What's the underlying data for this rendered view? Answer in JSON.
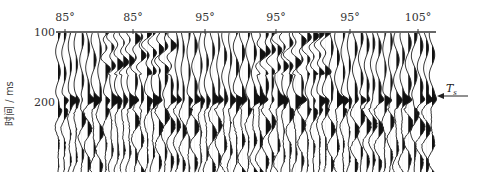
{
  "chart_data": {
    "type": "seismic-wiggle-section",
    "title": "",
    "xlabel": "",
    "ylabel": "时间 / ms",
    "x_tick_labels": [
      "85°",
      "85°",
      "95°",
      "95°",
      "95°",
      "105°"
    ],
    "y_tick_labels": [
      "100",
      "200"
    ],
    "y_ticks_ms": [
      100,
      200
    ],
    "ylim_ms": [
      100,
      300
    ],
    "annotations": [
      {
        "text": "T",
        "subscript": "s",
        "type": "arrow",
        "points_to_time_ms": 190,
        "side": "right"
      }
    ],
    "features": {
      "trace_count": 64,
      "strong_reflector_time_ms": 190,
      "upper_dipping_events": [
        {
          "x_from_label_index": 1,
          "x_to_label_index": 2,
          "time_range_ms": [
            100,
            150
          ]
        },
        {
          "x_from_label_index": 3,
          "x_to_label_index": 4,
          "time_range_ms": [
            100,
            150
          ]
        }
      ],
      "grid": false
    }
  },
  "axes": {
    "x_tick_positions_px": [
      65,
      133,
      205,
      276,
      350,
      418
    ],
    "y_tick_positions_px": [
      33,
      103
    ]
  },
  "labels": {
    "ylabel": "时间 / ms",
    "ts_main": "T",
    "ts_sub": "s"
  }
}
